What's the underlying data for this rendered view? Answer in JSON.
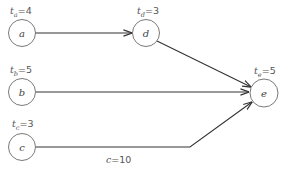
{
  "diagram": {
    "type": "network-graph",
    "nodes": [
      {
        "id": "a",
        "label": "a",
        "time_var": "t",
        "time_sub": "a",
        "time_value": "=4"
      },
      {
        "id": "b",
        "label": "b",
        "time_var": "t",
        "time_sub": "b",
        "time_value": "=5"
      },
      {
        "id": "c",
        "label": "c",
        "time_var": "t",
        "time_sub": "c",
        "time_value": "=3"
      },
      {
        "id": "d",
        "label": "d",
        "time_var": "t",
        "time_sub": "d",
        "time_value": "=3"
      },
      {
        "id": "e",
        "label": "e",
        "time_var": "t",
        "time_sub": "e",
        "time_value": "=5"
      }
    ],
    "edges": [
      {
        "from": "a",
        "to": "d"
      },
      {
        "from": "d",
        "to": "e"
      },
      {
        "from": "b",
        "to": "e"
      },
      {
        "from": "c",
        "to": "e",
        "label_var": "c",
        "label_value": "=10"
      }
    ],
    "colors": {
      "node_stroke": "#6a6a6a",
      "edge": "#333333",
      "text": "#555555"
    }
  }
}
